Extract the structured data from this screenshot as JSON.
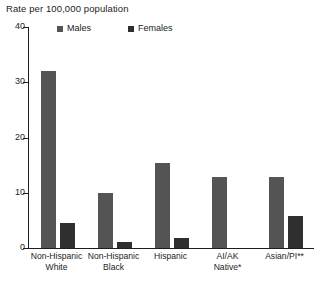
{
  "chart_data": {
    "type": "bar",
    "title": "Rate per 100,000 population",
    "xlabel": "",
    "ylabel": "Rate per 100,000 population",
    "ylim": [
      0,
      40
    ],
    "yticks": [
      0,
      10,
      20,
      30,
      40
    ],
    "ytick_labels": [
      "0",
      "10",
      "20",
      "30",
      "40"
    ],
    "grid": false,
    "legend_position": "top",
    "categories": [
      "Non-Hispanic\nWhite",
      "Non-Hispanic\nBlack",
      "Hispanic",
      "AI/AK\nNative*",
      "Asian/PI**"
    ],
    "series": [
      {
        "name": "Males",
        "color": "#545454",
        "values": [
          32.0,
          10.0,
          15.4,
          12.8,
          12.8
        ]
      },
      {
        "name": "Females",
        "color": "#2f2f2f",
        "values": [
          4.5,
          1.1,
          1.8,
          0,
          5.8
        ]
      }
    ],
    "annotations": [
      "*",
      "**"
    ]
  },
  "legend": {
    "items": [
      {
        "label": "Males",
        "color": "#545454"
      },
      {
        "label": "Females",
        "color": "#2f2f2f"
      }
    ]
  },
  "axis": {
    "title": "Rate per 100,000 population",
    "tick_40": "40",
    "tick_30": "30",
    "tick_20": "20",
    "tick_10": "10",
    "tick_0": "0"
  },
  "categories": {
    "c0": "Non-Hispanic\nWhite",
    "c1": "Non-Hispanic\nBlack",
    "c2": "Hispanic",
    "c3": "AI/AK\nNative*",
    "c4": "Asian/PI**"
  }
}
